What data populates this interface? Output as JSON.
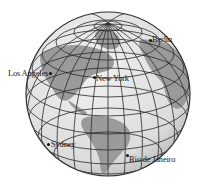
{
  "figure": {
    "type": "globe",
    "colors": {
      "ocean": "#e4e4e4",
      "land": "#9a9a9a",
      "grid": "#2a2a2a",
      "outline": "#333333",
      "label": "#1a1a1a"
    }
  },
  "cities": [
    {
      "name": "Berlin",
      "dot_x": 150,
      "dot_y": 40,
      "label_x": 152,
      "label_y": 36
    },
    {
      "name": "Los Angeles",
      "dot_x": 50,
      "dot_y": 73,
      "label_x": 8,
      "label_y": 69
    },
    {
      "name": "New York",
      "dot_x": 94,
      "dot_y": 77,
      "label_x": 96,
      "label_y": 75
    },
    {
      "name": "Sydney",
      "dot_x": 48,
      "dot_y": 144,
      "label_x": 51,
      "label_y": 141
    },
    {
      "name": "Rio de Janeiro",
      "dot_x": 127,
      "dot_y": 155,
      "label_x": 129,
      "label_y": 155
    }
  ]
}
